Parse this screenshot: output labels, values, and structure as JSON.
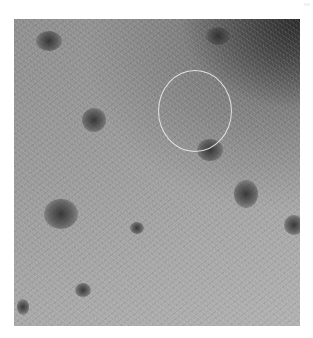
{
  "image": {
    "description": "Grayscale close-up photograph of skin surface with scattered dark spots and a thin white circular annotation",
    "annotation": {
      "shape": "circle",
      "color": "#ebebeb"
    },
    "colors": {
      "background": "#ffffff",
      "skin_light": "#b0b0b0",
      "skin_mid": "#9a9a9a",
      "shadow_dark": "#1e1e1e",
      "spot": "#2d2d2d"
    }
  }
}
